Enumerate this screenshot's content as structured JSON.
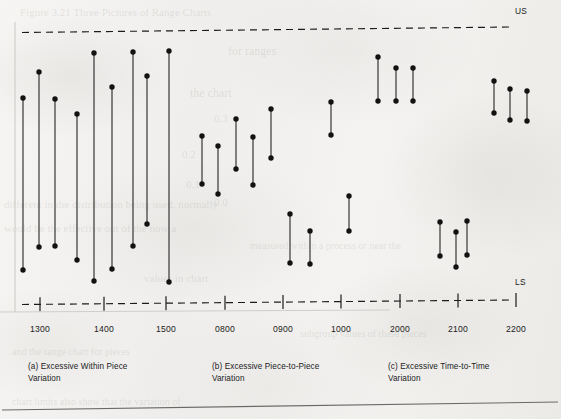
{
  "figure": {
    "spec_limits": {
      "upper_label": "US",
      "lower_label": "LS"
    },
    "axis": {
      "ticks": [
        "1300",
        "1400",
        "1500",
        "0800",
        "0900",
        "1000",
        "2000",
        "2100",
        "2200"
      ],
      "tick_x": [
        40,
        104,
        166,
        225,
        283,
        341,
        400,
        458,
        516
      ]
    },
    "captions": [
      {
        "id": "a",
        "text": "(a) Excessive Within Piece\n      Variation",
        "x": 28,
        "y": 361
      },
      {
        "id": "b",
        "text": "(b) Excessive Piece-to-Piece\n      Variation",
        "x": 212,
        "y": 361
      },
      {
        "id": "c",
        "text": "(c) Excessive Time-to-Time\n      Variation",
        "x": 388,
        "y": 361
      }
    ]
  },
  "chart_data": {
    "type": "line",
    "title": "",
    "subtitle": "",
    "xlabel": "",
    "ylabel": "",
    "grid": false,
    "legend": "none",
    "upper_spec_y": 31,
    "lower_spec_y": 303,
    "xlim": [
      14,
      540
    ],
    "series": [
      {
        "name": "(a) Excessive Within Piece Variation",
        "group": "a",
        "points": [
          {
            "x": 23,
            "top": 98,
            "bottom": 270
          },
          {
            "x": 39,
            "top": 72,
            "bottom": 247
          },
          {
            "x": 55,
            "top": 99,
            "bottom": 246
          },
          {
            "x": 77,
            "top": 114,
            "bottom": 260
          },
          {
            "x": 94,
            "top": 53,
            "bottom": 281
          },
          {
            "x": 112,
            "top": 87,
            "bottom": 269
          },
          {
            "x": 133,
            "top": 52,
            "bottom": 246
          },
          {
            "x": 147,
            "top": 76,
            "bottom": 224
          },
          {
            "x": 169,
            "top": 51,
            "bottom": 282
          }
        ]
      },
      {
        "name": "(b) Excessive Piece-to-Piece Variation",
        "group": "b",
        "points": [
          {
            "x": 202,
            "top": 136,
            "bottom": 184
          },
          {
            "x": 218,
            "top": 146,
            "bottom": 194
          },
          {
            "x": 236,
            "top": 119,
            "bottom": 169
          },
          {
            "x": 253,
            "top": 137,
            "bottom": 185
          },
          {
            "x": 271,
            "top": 109,
            "bottom": 158
          },
          {
            "x": 290,
            "top": 214,
            "bottom": 263
          },
          {
            "x": 310,
            "top": 231,
            "bottom": 264
          },
          {
            "x": 331,
            "top": 102,
            "bottom": 135
          },
          {
            "x": 349,
            "top": 196,
            "bottom": 231
          }
        ]
      },
      {
        "name": "(c) Excessive Time-to-Time Variation",
        "group": "c",
        "points": [
          {
            "x": 378,
            "top": 57,
            "bottom": 101
          },
          {
            "x": 396,
            "top": 68,
            "bottom": 101
          },
          {
            "x": 413,
            "top": 68,
            "bottom": 101
          },
          {
            "x": 440,
            "top": 222,
            "bottom": 256
          },
          {
            "x": 456,
            "top": 232,
            "bottom": 267
          },
          {
            "x": 467,
            "top": 221,
            "bottom": 255
          },
          {
            "x": 494,
            "top": 81,
            "bottom": 113
          },
          {
            "x": 510,
            "top": 89,
            "bottom": 120
          },
          {
            "x": 527,
            "top": 91,
            "bottom": 121
          }
        ]
      }
    ]
  },
  "ghost_text": [
    {
      "t": "Figure 3.21  Three Pictures of Range Charts",
      "x": 20,
      "y": 6,
      "s": 11
    },
    {
      "t": "for  ranges",
      "x": 228,
      "y": 44,
      "s": 12
    },
    {
      "t": "the   chart",
      "x": 190,
      "y": 86,
      "s": 12
    },
    {
      "t": "0.3",
      "x": 214,
      "y": 112,
      "s": 11
    },
    {
      "t": "0.2",
      "x": 182,
      "y": 148,
      "s": 11
    },
    {
      "t": "0.1",
      "x": 186,
      "y": 178,
      "s": 11
    },
    {
      "t": "0.0",
      "x": 214,
      "y": 196,
      "s": 11
    },
    {
      "t": "different in the distribution being used,  normally",
      "x": 4,
      "y": 198,
      "s": 11
    },
    {
      "t": "would be the effective out of the   now   a",
      "x": 4,
      "y": 222,
      "s": 11
    },
    {
      "t": "values    in   chart",
      "x": 144,
      "y": 272,
      "s": 11
    },
    {
      "t": "measured within a process or   near the",
      "x": 250,
      "y": 240,
      "s": 10
    },
    {
      "t": "subgroup  values  of  these  pieces",
      "x": 300,
      "y": 328,
      "s": 10
    },
    {
      "t": "and  the  range  chart  for  pieces",
      "x": 12,
      "y": 346,
      "s": 10
    },
    {
      "t": "chart  limits  also  show  that  the  variation  of",
      "x": 12,
      "y": 396,
      "s": 10
    }
  ]
}
